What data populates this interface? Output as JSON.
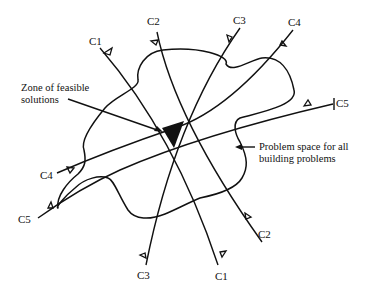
{
  "diagram": {
    "title": "",
    "colors": {
      "ink": "#111111",
      "background": "#ffffff",
      "feasible_zone_fill": "#111111"
    },
    "constraints": [
      {
        "id": "C1",
        "label_start": "C1",
        "label_end": "C1"
      },
      {
        "id": "C2",
        "label_start": "C2",
        "label_end": "C2"
      },
      {
        "id": "C3",
        "label_start": "C3",
        "label_end": "C3"
      },
      {
        "id": "C4",
        "label_start": "C4",
        "label_end": "C4"
      },
      {
        "id": "C5",
        "label_start": "C5",
        "label_end": "C5"
      }
    ],
    "annotations": {
      "feasible_zone_line1": "Zone of feasible",
      "feasible_zone_line2": "solutions",
      "problem_space_line1": "Problem space for all",
      "problem_space_line2": "building problems"
    }
  }
}
